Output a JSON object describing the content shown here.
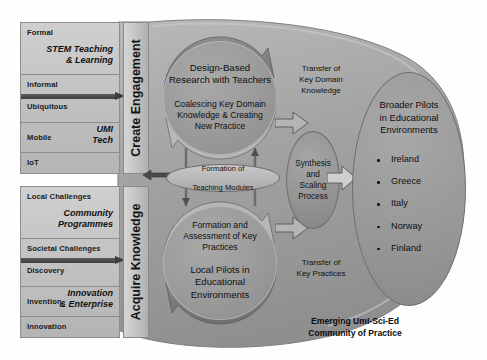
{
  "diagram": {
    "caption_line1": "Emerging UmI-Sci-Ed",
    "caption_line2": "Community of Practice",
    "colors": {
      "panel_fill": "#c4c4c4",
      "banner_fill": "#c6c6c6",
      "circle_fill": "#9a9a9a",
      "blob_fill": "#a0a0a0",
      "outline": "#8a8a8a",
      "text": "#111111"
    }
  },
  "left_top_panel": {
    "theme_line1": "STEM Teaching",
    "theme_line2": "& Learning",
    "segments": [
      {
        "label": "Formal"
      },
      {
        "label": "Informal"
      },
      {
        "label": "Ubiquitous"
      },
      {
        "label": "Mobile"
      },
      {
        "label": "IoT"
      }
    ],
    "tech_line1": "UMI",
    "tech_line2": "Tech"
  },
  "left_bottom_panel": {
    "theme_line1": "Community",
    "theme_line2": "Programmes",
    "segments": [
      {
        "label": "Local Challenges"
      },
      {
        "label": "Societal Challenges"
      },
      {
        "label": "Discovery"
      },
      {
        "label": "Invention"
      },
      {
        "label": "Innovation"
      }
    ],
    "tech_line1": "Innovation",
    "tech_line2": "& Enterprise"
  },
  "banners": {
    "top": "Create Engagement",
    "bottom": "Acquire Knowledge"
  },
  "cycle_top": {
    "main_line1": "Design-Based",
    "main_line2": "Research with Teachers",
    "sub_line1": "Coalescing Key Domain",
    "sub_line2": "Knowledge & Creating",
    "sub_line3": "New Practice"
  },
  "cycle_bottom": {
    "sub_line1": "Formation and",
    "sub_line2": "Assessment of Key",
    "sub_line3": "Practices",
    "main_line1": "Local Pilots in",
    "main_line2": "Educational",
    "main_line3": "Environments"
  },
  "modules_ellipse": {
    "line1": "Formation of",
    "line2": "Teaching Modules"
  },
  "transfer_top": {
    "line1": "Transfer of",
    "line2": "Key Domain",
    "line3": "Knowledge"
  },
  "transfer_bottom": {
    "line1": "Transfer of",
    "line2": "Key Practices"
  },
  "synthesis": {
    "line1": "Synthesis",
    "line2": "and",
    "line3": "Scaling",
    "line4": "Process"
  },
  "broader_pilots": {
    "title_line1": "Broader Pilots",
    "title_line2": "in Educational",
    "title_line3": "Environments",
    "countries": [
      {
        "name": "Ireland"
      },
      {
        "name": "Greece"
      },
      {
        "name": "Italy"
      },
      {
        "name": "Norway"
      },
      {
        "name": "Finland"
      }
    ]
  }
}
